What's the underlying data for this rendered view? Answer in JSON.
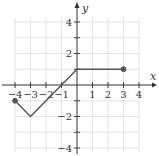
{
  "chart_data": {
    "type": "line",
    "title": "",
    "xlabel": "x",
    "ylabel": "y",
    "xlim": [
      -4,
      4
    ],
    "ylim": [
      -4,
      4
    ],
    "grid": true,
    "x_ticks": [
      -4,
      -3,
      -2,
      -1,
      1,
      2,
      3,
      4
    ],
    "x_tick_labels": [
      "−4",
      "−3",
      "−2",
      "−1",
      "1",
      "2",
      "3",
      "4"
    ],
    "y_ticks": [
      -4,
      -2,
      2,
      4
    ],
    "y_tick_labels": [
      "−4",
      "−2",
      "2",
      "4"
    ],
    "series": [
      {
        "name": "f(x)",
        "points": [
          [
            -4,
            -1
          ],
          [
            -3,
            -2
          ],
          [
            0,
            1
          ],
          [
            3,
            1
          ]
        ],
        "endpoints": [
          {
            "x": -4,
            "y": -1,
            "style": "closed"
          },
          {
            "x": 3,
            "y": 1,
            "style": "closed"
          }
        ],
        "color": "#555555"
      }
    ]
  },
  "colors": {
    "axis": "#333333",
    "grid": "#dddddd",
    "line": "#555555"
  }
}
